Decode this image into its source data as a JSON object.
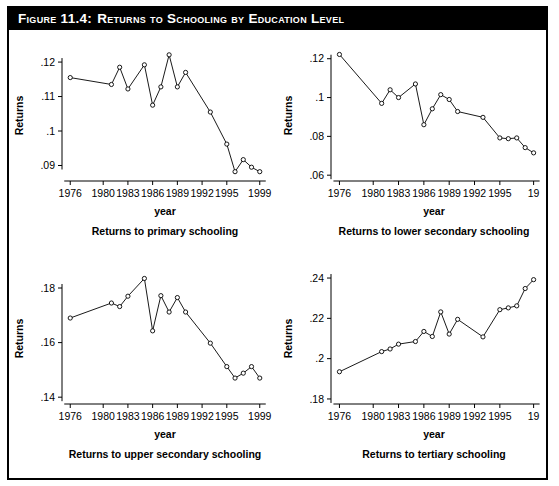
{
  "figure": {
    "number_label": "Figure 11.4:",
    "title": "Returns to Schooling by Education Level"
  },
  "chart_data": [
    {
      "type": "line",
      "title": "Returns to primary schooling",
      "xlabel": "year",
      "ylabel": "Returns",
      "xlim": [
        1975,
        2000
      ],
      "ylim": [
        0.0855,
        0.1235
      ],
      "xticks": [
        1976,
        1980,
        1983,
        1986,
        1989,
        1992,
        1995,
        1999
      ],
      "xticklabels": [
        "1976",
        "1980",
        "1983",
        "1986",
        "1989",
        "1992",
        "1995",
        "1999"
      ],
      "yticks": [
        0.09,
        0.1,
        0.11,
        0.12
      ],
      "yticklabels": [
        ".09",
        ".1",
        ".11",
        ".12"
      ],
      "grid": false,
      "legend": "none",
      "x": [
        1976,
        1981,
        1982,
        1983,
        1985,
        1986,
        1987,
        1988,
        1989,
        1990,
        1993,
        1995,
        1996,
        1997,
        1998,
        1999
      ],
      "values": [
        0.1155,
        0.1135,
        0.1185,
        0.1122,
        0.1192,
        0.1075,
        0.1128,
        0.1221,
        0.1128,
        0.117,
        0.1055,
        0.0962,
        0.0882,
        0.0917,
        0.0895,
        0.0882
      ]
    },
    {
      "type": "line",
      "title": "Returns to lower secondary schooling",
      "xlabel": "year",
      "ylabel": "Returns",
      "xlim": [
        1975,
        1999.4
      ],
      "ylim": [
        0.057,
        0.1245
      ],
      "xticks": [
        1976,
        1980,
        1983,
        1986,
        1989,
        1992,
        1995,
        1999
      ],
      "xticklabels": [
        "1976",
        "1980",
        "1983",
        "1986",
        "1989",
        "1992",
        "1995",
        "19"
      ],
      "yticks": [
        0.06,
        0.08,
        0.1,
        0.12
      ],
      "yticklabels": [
        ".06",
        ".08",
        ".1",
        ".12"
      ],
      "grid": false,
      "legend": "none",
      "x": [
        1976,
        1981,
        1982,
        1983,
        1985,
        1986,
        1987,
        1988,
        1989,
        1990,
        1993,
        1995,
        1996,
        1997,
        1998,
        1999
      ],
      "values": [
        0.1222,
        0.097,
        0.104,
        0.1,
        0.107,
        0.086,
        0.0942,
        0.1015,
        0.099,
        0.0928,
        0.0898,
        0.0792,
        0.0788,
        0.0792,
        0.0742,
        0.0715
      ]
    },
    {
      "type": "line",
      "title": "Returns to upper secondary schooling",
      "xlabel": "year",
      "ylabel": "Returns",
      "xlim": [
        1975,
        2000
      ],
      "ylim": [
        0.1375,
        0.1855
      ],
      "xticks": [
        1976,
        1980,
        1983,
        1986,
        1989,
        1992,
        1995,
        1999
      ],
      "xticklabels": [
        "1976",
        "1980",
        "1983",
        "1986",
        "1989",
        "1992",
        "1995",
        "1999"
      ],
      "yticks": [
        0.14,
        0.16,
        0.18
      ],
      "yticklabels": [
        ".14",
        ".16",
        ".18"
      ],
      "grid": false,
      "legend": "none",
      "x": [
        1976,
        1981,
        1982,
        1983,
        1985,
        1986,
        1987,
        1988,
        1989,
        1990,
        1993,
        1995,
        1996,
        1997,
        1998,
        1999
      ],
      "values": [
        0.169,
        0.1745,
        0.1732,
        0.177,
        0.1835,
        0.1643,
        0.1772,
        0.1712,
        0.1765,
        0.1712,
        0.1598,
        0.1512,
        0.147,
        0.1488,
        0.1512,
        0.147
      ]
    },
    {
      "type": "line",
      "title": "Returns to tertiary schooling",
      "xlabel": "year",
      "ylabel": "Returns",
      "xlim": [
        1975,
        1999.4
      ],
      "ylim": [
        0.1775,
        0.2425
      ],
      "xticks": [
        1976,
        1980,
        1983,
        1986,
        1989,
        1992,
        1995,
        1999
      ],
      "xticklabels": [
        "1976",
        "1980",
        "1983",
        "1986",
        "1989",
        "1992",
        "1995",
        "19"
      ],
      "yticks": [
        0.18,
        0.2,
        0.22,
        0.24
      ],
      "yticklabels": [
        ".18",
        ".2",
        ".22",
        ".24"
      ],
      "grid": false,
      "legend": "none",
      "x": [
        1976,
        1981,
        1982,
        1983,
        1985,
        1986,
        1987,
        1988,
        1989,
        1990,
        1993,
        1995,
        1996,
        1997,
        1998,
        1999
      ],
      "values": [
        0.1935,
        0.2035,
        0.2048,
        0.2072,
        0.2085,
        0.2135,
        0.211,
        0.2232,
        0.2122,
        0.2195,
        0.2108,
        0.2243,
        0.2252,
        0.2262,
        0.2348,
        0.2392
      ]
    }
  ]
}
